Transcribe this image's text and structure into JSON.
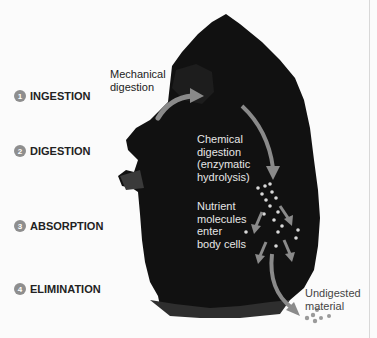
{
  "figure": {
    "stages": [
      {
        "number": "1",
        "label": "INGESTION"
      },
      {
        "number": "2",
        "label": "DIGESTION"
      },
      {
        "number": "3",
        "label": "ABSORPTION"
      },
      {
        "number": "4",
        "label": "ELIMINATION"
      }
    ],
    "annotations": {
      "mechanical": [
        "Mechanical",
        "digestion"
      ],
      "chemical": [
        "Chemical",
        "digestion",
        "(enzymatic",
        "hydrolysis)"
      ],
      "nutrient": [
        "Nutrient",
        "molecules",
        "enter",
        "body cells"
      ],
      "undigested": [
        "Undigested",
        "material"
      ]
    },
    "colors": {
      "background": "#fbfbfb",
      "silhouette": "#111111",
      "arrow": "#8a8a8a",
      "badge": "#8e8e8e",
      "light_text": "#e6e6e6"
    }
  }
}
